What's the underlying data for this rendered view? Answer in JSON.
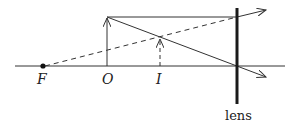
{
  "diagram": {
    "labels": {
      "focal_point": "F",
      "object": "O",
      "image": "I",
      "lens": "lens"
    },
    "colors": {
      "line": "#333333",
      "lens": "#1a1a1a"
    }
  }
}
